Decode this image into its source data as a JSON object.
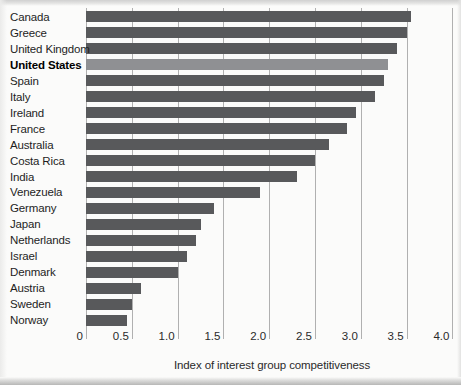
{
  "chart_data": {
    "type": "bar",
    "orientation": "horizontal",
    "title": "",
    "xlabel": "Index of interest group competitiveness",
    "ylabel": "",
    "xlim": [
      0,
      4.0
    ],
    "xticks": [
      0,
      0.5,
      1.0,
      1.5,
      2.0,
      2.5,
      3.0,
      3.5,
      4.0
    ],
    "xtick_labels": [
      "0",
      "0.5",
      "1.0",
      "1.5",
      "2.0",
      "2.5",
      "3.0",
      "3.5",
      "4.0"
    ],
    "grid": true,
    "legend": false,
    "categories": [
      "Canada",
      "Greece",
      "United Kingdom",
      "United States",
      "Spain",
      "Italy",
      "Ireland",
      "France",
      "Australia",
      "Costa Rica",
      "India",
      "Venezuela",
      "Germany",
      "Japan",
      "Netherlands",
      "Israel",
      "Denmark",
      "Austria",
      "Sweden",
      "Norway"
    ],
    "values": [
      3.55,
      3.5,
      3.4,
      3.3,
      3.25,
      3.15,
      2.95,
      2.85,
      2.65,
      2.5,
      2.3,
      1.9,
      1.4,
      1.25,
      1.2,
      1.1,
      1.0,
      0.6,
      0.5,
      0.45
    ],
    "highlighted_category": "United States",
    "highlight_index": 3,
    "colors": {
      "bar": "#58595b",
      "highlight_bar": "#8f9093",
      "gridline": "#b0b0b0",
      "category_text": "#1e1e1e",
      "highlight_text": "#000000",
      "tick_text": "#2a2a2a",
      "axis_label_text": "#2a2a2a"
    }
  }
}
